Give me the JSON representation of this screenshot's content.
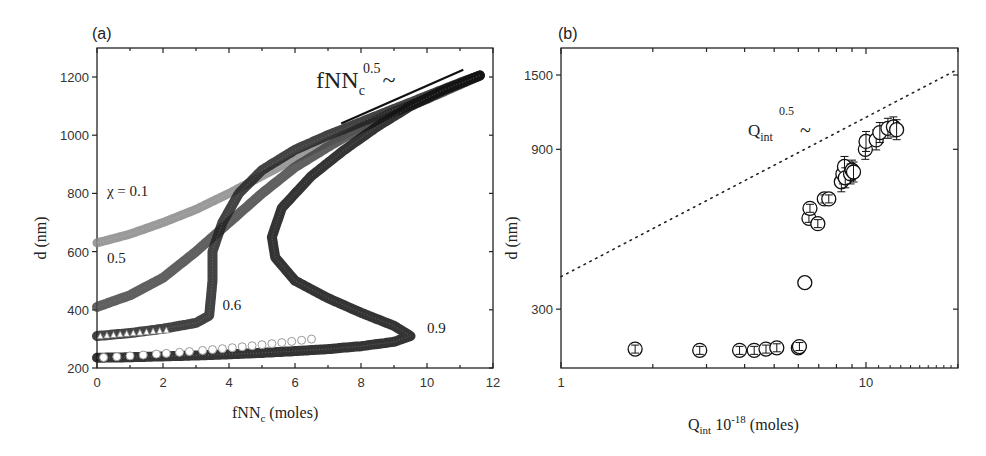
{
  "chart_data": [
    {
      "panel": "(a)",
      "type": "scatter",
      "xlabel": "fNN_c (moles)",
      "xlabel_main": "fNN",
      "xlabel_sub": "c",
      "xlabel_rest": " (moles)",
      "ylabel": "d  (nm)",
      "xlim": [
        0,
        12
      ],
      "ylim": [
        200,
        1300
      ],
      "xticks": [
        0,
        2,
        4,
        6,
        8,
        10,
        12
      ],
      "yticks": [
        200,
        400,
        600,
        800,
        1000,
        1200
      ],
      "grid": false,
      "annotation": {
        "main": "fNN",
        "sub": "c",
        "sup": "0.5",
        "tilde": "~"
      },
      "reference_line": {
        "x": [
          7.4,
          11.1
        ],
        "y": [
          1040,
          1225
        ],
        "style": "solid"
      },
      "series": [
        {
          "name": "χ = 0.1",
          "label": "χ = 0.1",
          "marker": "square",
          "color": "#888888",
          "x": [
            0,
            1,
            2,
            3,
            4,
            5,
            6,
            7,
            8,
            9,
            10,
            11,
            11.6
          ],
          "y": [
            630,
            660,
            700,
            745,
            800,
            860,
            920,
            975,
            1030,
            1080,
            1125,
            1175,
            1205
          ]
        },
        {
          "name": "0.5",
          "label": "0.5",
          "marker": "square",
          "color": "#444444",
          "x": [
            0,
            1,
            2,
            3,
            4,
            5,
            6,
            7,
            8,
            9,
            10,
            11,
            11.6
          ],
          "y": [
            410,
            450,
            510,
            600,
            700,
            800,
            890,
            960,
            1025,
            1080,
            1125,
            1175,
            1205
          ]
        },
        {
          "name": "0.6",
          "label": "0.6",
          "marker": "triangle",
          "color": "#222222",
          "x": [
            0,
            1,
            2,
            3,
            3.4,
            3.5,
            3.5,
            3.8,
            4.3,
            5,
            6,
            7,
            8,
            9,
            10,
            11,
            11.6
          ],
          "y": [
            310,
            320,
            335,
            355,
            380,
            500,
            600,
            700,
            800,
            880,
            950,
            1000,
            1045,
            1090,
            1135,
            1180,
            1205
          ]
        },
        {
          "name": "0.9",
          "label": "0.9",
          "marker": "circle",
          "color": "#111111",
          "x": [
            0,
            1,
            2,
            3,
            4,
            5,
            6,
            7,
            8,
            9,
            9.5,
            9,
            8,
            7,
            6,
            5.4,
            5.3,
            5.6,
            6.5,
            7.5,
            8.5,
            9.5,
            10.5,
            11.6
          ],
          "y": [
            235,
            237,
            240,
            243,
            247,
            252,
            258,
            265,
            275,
            290,
            310,
            345,
            390,
            440,
            500,
            580,
            650,
            750,
            860,
            950,
            1030,
            1100,
            1155,
            1205
          ]
        }
      ],
      "series_labels": [
        {
          "text": "χ = 0.1",
          "x": 0.3,
          "y": 790
        },
        {
          "text": "0.5",
          "x": 0.3,
          "y": 560
        },
        {
          "text": "0.6",
          "x": 3.8,
          "y": 400
        },
        {
          "text": "0.9",
          "x": 10,
          "y": 320
        }
      ]
    },
    {
      "panel": "(b)",
      "type": "scatter",
      "xscale": "log",
      "yscale": "log",
      "xlabel": "Q_int 10^-18 (moles)",
      "xlabel_main": "Q",
      "xlabel_sub": "int",
      "xlabel_mid": "  10",
      "xlabel_sup": "-18",
      "xlabel_rest": " (moles)",
      "ylabel": "d  (nm)",
      "xlim": [
        1,
        20
      ],
      "ylim": [
        200,
        1800
      ],
      "xticks": [
        1,
        10
      ],
      "yticks": [
        300,
        900,
        1500
      ],
      "grid": false,
      "annotation": {
        "main": "Q",
        "sub": "int",
        "sup": "0.5",
        "tilde": "~"
      },
      "reference_line": {
        "x": [
          1,
          20
        ],
        "y": [
          375,
          1560
        ],
        "style": "dotted"
      },
      "series": [
        {
          "name": "measured d",
          "marker": "open-circle-with-errorbars",
          "color": "#111111",
          "x": [
            1.75,
            2.85,
            3.85,
            4.3,
            4.7,
            5.1,
            6.0,
            6.05,
            6.3,
            6.5,
            6.55,
            6.95,
            7.3,
            7.55,
            8.3,
            8.4,
            8.5,
            8.55,
            8.9,
            9.0,
            9.1,
            9.95,
            10.0,
            10.8,
            11.1,
            11.8,
            12.3,
            12.6
          ],
          "y": [
            228,
            226,
            226,
            226,
            228,
            230,
            230,
            232,
            360,
            560,
            600,
            540,
            640,
            640,
            720,
            760,
            800,
            740,
            760,
            780,
            770,
            900,
            950,
            960,
            1010,
            1040,
            1050,
            1030
          ]
        }
      ]
    }
  ]
}
